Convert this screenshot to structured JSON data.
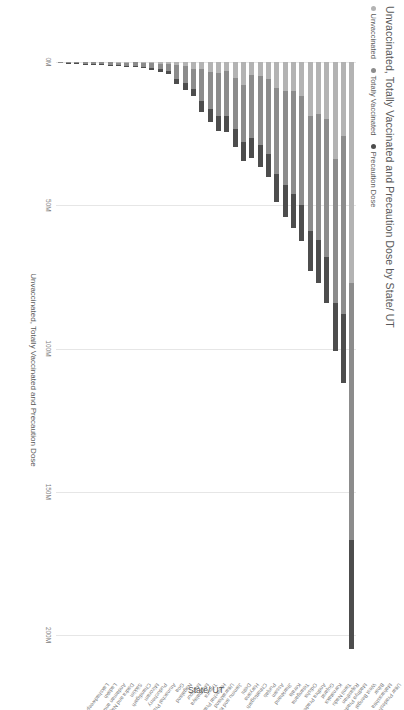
{
  "chart": {
    "title": "Unvaccinated, Totally Vaccinated and Precaution Dose by State/ UT",
    "legend_items": [
      {
        "label": "Unvaccinated",
        "color": "#b3b3b3"
      },
      {
        "label": "Totally Vaccinated",
        "color": "#8c8c8c"
      },
      {
        "label": "Precaution Dose",
        "color": "#4d4d4d"
      }
    ],
    "value_axis_title": "Unvaccinated, Totally Vaccinated and Precaution Dose",
    "category_axis_title": "State/ UT"
  },
  "chart_data": {
    "type": "bar",
    "orientation": "horizontal",
    "stacked": true,
    "title": "Unvaccinated, Totally Vaccinated and Precaution Dose by State/ UT",
    "xlabel": "Unvaccinated, Totally Vaccinated and Precaution Dose",
    "ylabel": "State/ UT",
    "xlim": [
      0,
      215000000
    ],
    "xticks": [
      0,
      50000000,
      100000000,
      150000000,
      200000000
    ],
    "xticklabels": [
      "0M",
      "50M",
      "100M",
      "150M",
      "200M"
    ],
    "grid": true,
    "legend_position": "top-left",
    "categories": [
      "Uttar Pradesh",
      "Maharashtra",
      "Bihar",
      "West Bengal",
      "Madhya Pradesh",
      "Rajasthan",
      "Tamil Nadu",
      "Karnataka",
      "Gujarat",
      "Andhra Pradesh",
      "Odisha",
      "Telangana",
      "Kerala",
      "Jharkhand",
      "Assam",
      "Punjab",
      "Chhattisgarh",
      "Haryana",
      "Delhi",
      "Jammu and Kashmir",
      "Uttarakhand",
      "Himachal Pradesh",
      "Tripura",
      "Meghalaya",
      "Manipur",
      "Nagaland",
      "Goa",
      "Arunachal Pradesh",
      "Puducherry",
      "Mizoram",
      "Chandigarh",
      "Sikkim",
      "Dadra and Nagar Haveli and Daman and Diu",
      "Andaman and Nicobar Islands",
      "Ladakh",
      "Lakshadweep"
    ],
    "series": [
      {
        "name": "Precaution Dose",
        "color": "#4d4d4d",
        "values": [
          38000000,
          24000000,
          17000000,
          16000000,
          15000000,
          14000000,
          12500000,
          12000000,
          11000000,
          10000000,
          8000000,
          7500000,
          7000000,
          6500000,
          6000000,
          5500000,
          5000000,
          4500000,
          4000000,
          2500000,
          2200000,
          1800000,
          1000000,
          900000,
          700000,
          500000,
          450000,
          400000,
          350000,
          300000,
          250000,
          200000,
          180000,
          120000,
          90000,
          20000
        ]
      },
      {
        "name": "Totally Vaccinated",
        "color": "#8c8c8c",
        "values": [
          90000000,
          62000000,
          50000000,
          48000000,
          44000000,
          40000000,
          38000000,
          36000000,
          33000000,
          30000000,
          26000000,
          24000000,
          22000000,
          20000000,
          18000000,
          16000000,
          15000000,
          13000000,
          11000000,
          7000000,
          6000000,
          5000000,
          2600000,
          1800000,
          1600000,
          1300000,
          1100000,
          900000,
          850000,
          750000,
          700000,
          500000,
          450000,
          300000,
          200000,
          50000
        ]
      },
      {
        "name": "Unvaccinated",
        "color": "#b3b3b3",
        "values": [
          77000000,
          26000000,
          34000000,
          20000000,
          18000000,
          19000000,
          12000000,
          10000000,
          10000000,
          9000000,
          6000000,
          5000000,
          4500000,
          8000000,
          5500000,
          3000000,
          4000000,
          3500000,
          2500000,
          2500000,
          1500000,
          1000000,
          600000,
          800000,
          500000,
          400000,
          150000,
          350000,
          200000,
          150000,
          120000,
          100000,
          120000,
          80000,
          50000,
          10000
        ]
      }
    ],
    "totals": [
      205000000,
      112000000,
      101000000,
      84000000,
      77000000,
      73000000,
      62500000,
      58000000,
      54000000,
      49000000,
      40000000,
      36500000,
      33500000,
      34500000,
      29500000,
      24500000,
      24000000,
      21000000,
      17500000,
      12000000,
      9700000,
      7800000,
      4200000,
      3500000,
      2800000,
      2200000,
      1700000,
      1650000,
      1400000,
      1200000,
      1070000,
      800000,
      750000,
      500000,
      340000,
      80000
    ]
  }
}
